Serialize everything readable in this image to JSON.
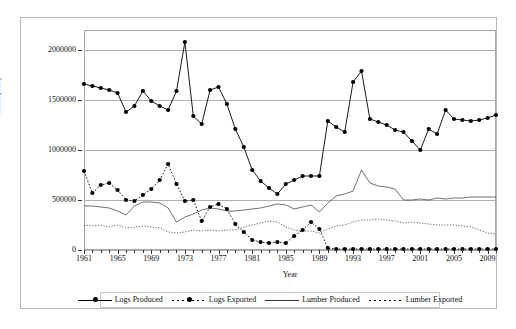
{
  "chart_data": {
    "type": "line",
    "title": "",
    "xlabel": "Year",
    "ylabel": "Volume( m3)",
    "xlim": [
      1961,
      2010
    ],
    "ylim": [
      0,
      2200000
    ],
    "yticks": [
      0,
      500000,
      1000000,
      1500000,
      2000000
    ],
    "ytick_labels": [
      "0",
      "500000",
      "1000000",
      "1500000",
      "2000000"
    ],
    "xticks": [
      1961,
      1965,
      1969,
      1973,
      1977,
      1981,
      1985,
      1989,
      1993,
      1997,
      2001,
      2005,
      2009
    ],
    "xtick_labels": [
      "1961",
      "1965",
      "1969",
      "1973",
      "1977",
      "1981",
      "1985",
      "1989",
      "1993",
      "1997",
      "2001",
      "2005",
      "2009"
    ],
    "grid": "horizontal",
    "legend_position": "bottom",
    "x": [
      1961,
      1962,
      1963,
      1964,
      1965,
      1966,
      1967,
      1968,
      1969,
      1970,
      1971,
      1972,
      1973,
      1974,
      1975,
      1976,
      1977,
      1978,
      1979,
      1980,
      1981,
      1982,
      1983,
      1984,
      1985,
      1986,
      1987,
      1988,
      1989,
      1990,
      1991,
      1992,
      1993,
      1994,
      1995,
      1996,
      1997,
      1998,
      1999,
      2000,
      2001,
      2002,
      2003,
      2004,
      2005,
      2006,
      2007,
      2008,
      2009,
      2010
    ],
    "series": [
      {
        "name": "Logs Produced",
        "style": "solid-marker",
        "color": "#000000",
        "values": [
          1660000,
          1640000,
          1620000,
          1600000,
          1570000,
          1380000,
          1440000,
          1590000,
          1490000,
          1440000,
          1400000,
          1590000,
          2080000,
          1340000,
          1260000,
          1600000,
          1630000,
          1460000,
          1210000,
          1030000,
          800000,
          690000,
          620000,
          560000,
          660000,
          700000,
          740000,
          740000,
          740000,
          1290000,
          1230000,
          1180000,
          1680000,
          1790000,
          1310000,
          1280000,
          1250000,
          1200000,
          1180000,
          1090000,
          1000000,
          1210000,
          1160000,
          1400000,
          1310000,
          1300000,
          1290000,
          1300000,
          1320000,
          1350000
        ]
      },
      {
        "name": "Logs Exported",
        "style": "dotted-marker",
        "color": "#000000",
        "values": [
          790000,
          570000,
          650000,
          670000,
          600000,
          500000,
          490000,
          550000,
          610000,
          700000,
          860000,
          660000,
          490000,
          500000,
          290000,
          430000,
          460000,
          410000,
          260000,
          180000,
          100000,
          80000,
          70000,
          80000,
          70000,
          140000,
          200000,
          280000,
          210000,
          20000,
          10000,
          10000,
          10000,
          10000,
          10000,
          10000,
          10000,
          10000,
          10000,
          10000,
          10000,
          10000,
          10000,
          10000,
          10000,
          10000,
          10000,
          10000,
          10000,
          10000
        ]
      },
      {
        "name": "Lumber Produced",
        "style": "solid-thin",
        "color": "#333333",
        "values": [
          440000,
          440000,
          430000,
          420000,
          390000,
          350000,
          440000,
          480000,
          480000,
          470000,
          420000,
          280000,
          330000,
          360000,
          400000,
          420000,
          410000,
          390000,
          390000,
          400000,
          410000,
          420000,
          440000,
          460000,
          450000,
          410000,
          430000,
          450000,
          380000,
          470000,
          540000,
          560000,
          590000,
          800000,
          670000,
          640000,
          630000,
          610000,
          500000,
          500000,
          510000,
          500000,
          520000,
          510000,
          520000,
          520000,
          530000,
          530000,
          530000,
          530000
        ]
      },
      {
        "name": "Lumber Exported",
        "style": "dotted-thin",
        "color": "#222222",
        "values": [
          250000,
          240000,
          250000,
          230000,
          250000,
          220000,
          230000,
          240000,
          230000,
          220000,
          180000,
          170000,
          180000,
          200000,
          190000,
          200000,
          190000,
          200000,
          200000,
          230000,
          250000,
          270000,
          290000,
          280000,
          230000,
          200000,
          190000,
          190000,
          170000,
          210000,
          240000,
          250000,
          280000,
          300000,
          300000,
          310000,
          300000,
          290000,
          270000,
          280000,
          270000,
          260000,
          250000,
          250000,
          250000,
          240000,
          230000,
          200000,
          170000,
          160000
        ]
      }
    ],
    "legend": [
      "Logs Produced",
      "Logs Exported",
      "Lumber Produced",
      "Lumber Exported"
    ]
  }
}
